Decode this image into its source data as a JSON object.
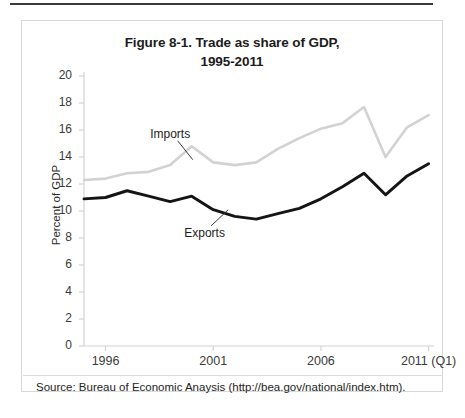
{
  "figure": {
    "title_line1": "Figure 8-1. Trade as share of GDP,",
    "title_line2": "1995-2011",
    "source_note": "Source: Bureau of Economic Anaysis (http://bea.gov/national/index.htm)."
  },
  "colors": {
    "imports_line": "#d2d2d2",
    "exports_line": "#141414",
    "axis": "#d4d4d4",
    "border": "#d8d8d8",
    "text": "#2b2b2b",
    "top_rule": "#3a3a3a"
  },
  "chart_data": {
    "type": "line",
    "title": "Figure 8-1. Trade as share of GDP, 1995-2011",
    "xlabel": "",
    "ylabel": "Percent of GDP",
    "ylim": [
      0,
      20
    ],
    "ytick_values": [
      0,
      2,
      4,
      6,
      8,
      10,
      12,
      14,
      16,
      18,
      20
    ],
    "ytick_labels": [
      "0",
      "2",
      "4",
      "6",
      "8",
      "10",
      "12",
      "14",
      "16",
      "18",
      "20"
    ],
    "xtick_labels": [
      "1996",
      "2001",
      "2006",
      "2011 (Q1)"
    ],
    "xtick_years": [
      1996,
      2001,
      2006,
      2011
    ],
    "xlim": [
      1995,
      2011.25
    ],
    "grid": false,
    "legend_position": "inline-annotations",
    "annotations": [
      {
        "text": "Imports",
        "year": 1999.0,
        "value": 15.6
      },
      {
        "text": "Exports",
        "year": 2000.6,
        "value": 8.3
      }
    ],
    "x": [
      1995,
      1996,
      1997,
      1998,
      1999,
      2000,
      2001,
      2002,
      2003,
      2004,
      2005,
      2006,
      2007,
      2008,
      2009,
      2010,
      2011
    ],
    "series": [
      {
        "name": "Imports",
        "color": "#d2d2d2",
        "values": [
          12.3,
          12.4,
          12.8,
          12.9,
          13.4,
          14.8,
          13.6,
          13.4,
          13.6,
          14.6,
          15.4,
          16.1,
          16.5,
          17.7,
          14.0,
          16.2,
          17.1
        ]
      },
      {
        "name": "Exports",
        "color": "#141414",
        "values": [
          10.9,
          11.0,
          11.5,
          11.1,
          10.7,
          11.1,
          10.1,
          9.6,
          9.4,
          9.8,
          10.2,
          10.9,
          11.8,
          12.8,
          11.2,
          12.6,
          13.5
        ]
      }
    ]
  }
}
